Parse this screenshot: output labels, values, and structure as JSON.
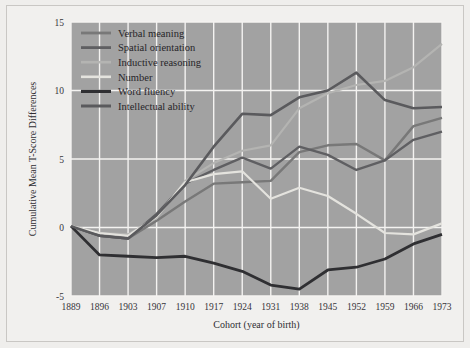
{
  "figure": {
    "background_color": "#efeeec",
    "frame_border_color": "#c9c7c4",
    "plot_background_color": "#a2a2a2",
    "gridline_color": "#f4f3f1"
  },
  "chart_data": {
    "type": "line",
    "title": "",
    "xlabel": "Cohort (year of birth)",
    "ylabel": "Cumulative Mean T-Score Differences",
    "categories": [
      "1889",
      "1896",
      "1903",
      "1907",
      "1910",
      "1917",
      "1924",
      "1931",
      "1938",
      "1945",
      "1952",
      "1959",
      "1966",
      "1973"
    ],
    "xtick_labels": [
      "1889",
      "1896",
      "1903",
      "1907",
      "1910",
      "1917",
      "1924",
      "1931",
      "1938",
      "1945",
      "1952",
      "1959",
      "1966",
      "1973"
    ],
    "ytick_labels": [
      "-5",
      "0",
      "5",
      "10",
      "15"
    ],
    "yticks": [
      -5,
      0,
      5,
      10,
      15
    ],
    "ylim": [
      -5,
      15
    ],
    "grid": true,
    "legend_position": "top-left",
    "series": [
      {
        "name": "Verbal meaning",
        "color": "#787878",
        "width": 2.4,
        "values": [
          0.1,
          -0.6,
          -0.8,
          0.5,
          1.9,
          3.2,
          3.3,
          3.4,
          5.5,
          6.0,
          6.1,
          4.9,
          7.4,
          8.0
        ]
      },
      {
        "name": "Spatial orientation",
        "color": "#5f5f62",
        "width": 2.4,
        "values": [
          0.1,
          -0.6,
          -0.8,
          1.0,
          3.2,
          4.2,
          5.1,
          4.3,
          5.9,
          5.3,
          4.2,
          4.9,
          6.4,
          7.0
        ]
      },
      {
        "name": "Inductive reasoning",
        "color": "#b4b4b2",
        "width": 2.2,
        "values": [
          0.1,
          -0.4,
          -0.5,
          0.7,
          3.4,
          4.7,
          5.6,
          6.0,
          8.7,
          9.8,
          10.4,
          10.7,
          11.7,
          13.4
        ]
      },
      {
        "name": "Number",
        "color": "#e4e3de",
        "width": 2.2,
        "values": [
          0.1,
          -0.4,
          -0.6,
          0.8,
          3.3,
          3.9,
          4.1,
          2.1,
          2.9,
          2.3,
          1.0,
          -0.4,
          -0.5,
          0.3
        ]
      },
      {
        "name": "Word fluency",
        "color": "#2f2f32",
        "width": 2.8,
        "values": [
          0.1,
          -2.0,
          -2.1,
          -2.2,
          -2.1,
          -2.6,
          -3.2,
          -4.2,
          -4.5,
          -3.1,
          -2.9,
          -2.3,
          -1.2,
          -0.5
        ]
      },
      {
        "name": "Intellectual ability",
        "color": "#5a5a5d",
        "width": 2.6,
        "values": [
          0.1,
          -0.6,
          -0.8,
          0.9,
          3.1,
          5.9,
          8.3,
          8.2,
          9.5,
          10.0,
          11.3,
          9.3,
          8.7,
          8.8
        ]
      }
    ]
  },
  "legend": {
    "entries": [
      {
        "label": "Verbal meaning"
      },
      {
        "label": "Spatial orientation"
      },
      {
        "label": "Inductive reasoning"
      },
      {
        "label": "Number"
      },
      {
        "label": "Word fluency"
      },
      {
        "label": "Intellectual ability"
      }
    ]
  }
}
